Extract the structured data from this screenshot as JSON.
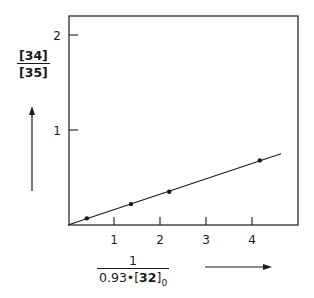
{
  "chart_data": {
    "type": "scatter",
    "title": "",
    "xlabel": "1 / (0.93·[32]0)",
    "ylabel": "[34] / [35]",
    "xlim": [
      0,
      4.95
    ],
    "ylim": [
      0,
      2.2
    ],
    "x_ticks": [
      1,
      2,
      3,
      4
    ],
    "y_ticks": [
      1,
      2
    ],
    "x_tick_labels": [
      "1",
      "2",
      "3",
      "4"
    ],
    "y_tick_labels": [
      "1",
      "2"
    ],
    "grid": false,
    "legend": null,
    "series": [
      {
        "name": "measured",
        "kind": "points",
        "x": [
          0.41,
          1.37,
          2.2,
          4.17
        ],
        "y": [
          0.07,
          0.22,
          0.35,
          0.68
        ]
      },
      {
        "name": "linear fit",
        "kind": "line",
        "x": [
          0,
          4.63
        ],
        "y": [
          0,
          0.75
        ]
      }
    ]
  },
  "labels": {
    "y_numerator": "[34]",
    "y_denominator": "[35]",
    "x_numerator": "1",
    "x_denominator_prefix": "0.93•[",
    "x_denominator_bold": "32",
    "x_denominator_suffix": "]",
    "x_denominator_subscript": "0"
  },
  "colors": {
    "ink": "#1a1a1a",
    "background": "#ffffff"
  }
}
